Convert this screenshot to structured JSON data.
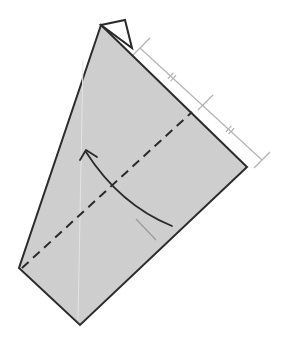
{
  "diagram": {
    "type": "origami-fold-step",
    "colors": {
      "background": "#ffffff",
      "paper_fill": "#cfcfcf",
      "outline": "#2a2a2a",
      "dashed_fold": "#2a2a2a",
      "measure_line": "#b4b4b4",
      "arrow": "#2a2a2a",
      "faint_line": "#9a9a9a"
    },
    "paper": {
      "points": "101,25 247,167 80,325 19,268"
    },
    "flap": {
      "points": "101,25 125,20 132,48"
    },
    "fold_line": {
      "x1": 22,
      "y1": 268,
      "x2": 192,
      "y2": 112,
      "style": "dashed"
    },
    "measure": {
      "x1": 140,
      "y1": 48,
      "x2": 262,
      "y2": 160,
      "end_ticks": [
        {
          "x1": 132,
          "y1": 56,
          "x2": 150,
          "y2": 38
        },
        {
          "x1": 198,
          "y1": 110,
          "x2": 213,
          "y2": 95
        },
        {
          "x1": 254,
          "y1": 168,
          "x2": 270,
          "y2": 152
        }
      ],
      "equal_marks": [
        {
          "cx": 172,
          "cy": 77
        },
        {
          "cx": 230,
          "cy": 130
        }
      ]
    },
    "arrow": {
      "path": "M172,226 Q120,205 86,152",
      "head": "M80,160 L86,150 L97,157"
    },
    "faint_line": {
      "x1": 136,
      "y1": 219,
      "x2": 156,
      "y2": 240
    }
  }
}
